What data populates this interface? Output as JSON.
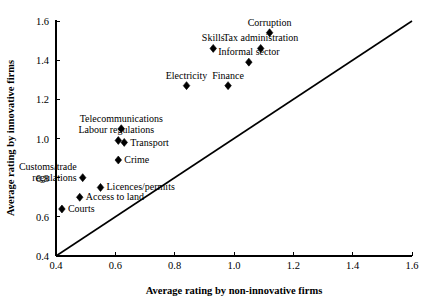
{
  "chart_data": {
    "type": "scatter",
    "title": "",
    "xlabel": "Average rating by non-innovative firms",
    "ylabel": "Average rating by innovative firms",
    "xlim": [
      0.4,
      1.6
    ],
    "ylim": [
      0.4,
      1.6
    ],
    "xticks": [
      "0.4",
      "0.6",
      "0.8",
      "1.0",
      "1.2",
      "1.4",
      "1.6"
    ],
    "yticks": [
      "0.4",
      "0.6",
      "0.8",
      "1.0",
      "1.2",
      "1.4",
      "1.6"
    ],
    "xtick_values": [
      0.4,
      0.6,
      0.8,
      1.0,
      1.2,
      1.4,
      1.6
    ],
    "ytick_values": [
      0.4,
      0.6,
      0.8,
      1.0,
      1.2,
      1.4,
      1.6
    ],
    "grid": false,
    "legend": false,
    "marker": "diamond",
    "marker_color": "#000000",
    "reference_line": {
      "name": "45-degree-line",
      "from": [
        0.4,
        0.4
      ],
      "to": [
        1.6,
        1.6
      ],
      "color": "#000000"
    },
    "points": [
      {
        "label": "Corruption",
        "x": 1.12,
        "y": 1.54,
        "label_dx": 0,
        "label_dy": -7,
        "anchor": "middle"
      },
      {
        "label": "Tax administration",
        "x": 1.09,
        "y": 1.46,
        "label_dx": 0,
        "label_dy": -7,
        "anchor": "middle"
      },
      {
        "label": "Skills",
        "x": 0.93,
        "y": 1.46,
        "label_dx": 0,
        "label_dy": -7,
        "anchor": "middle"
      },
      {
        "label": "Informal sector",
        "x": 1.05,
        "y": 1.39,
        "label_dx": 0,
        "label_dy": -7,
        "anchor": "middle"
      },
      {
        "label": "Electricity",
        "x": 0.84,
        "y": 1.27,
        "label_dx": 0,
        "label_dy": -7,
        "anchor": "middle"
      },
      {
        "label": "Finance",
        "x": 0.98,
        "y": 1.27,
        "label_dx": 0,
        "label_dy": -7,
        "anchor": "middle"
      },
      {
        "label": "Telecommunications",
        "x": 0.62,
        "y": 1.05,
        "label_dx": 0,
        "label_dy": -7,
        "anchor": "middle"
      },
      {
        "label": "Labour regulations",
        "x": 0.61,
        "y": 0.99,
        "label_dx": -2,
        "label_dy": -7,
        "anchor": "middle"
      },
      {
        "label": "Transport",
        "x": 0.63,
        "y": 0.98,
        "label_dx": 6,
        "label_dy": 4,
        "anchor": "start"
      },
      {
        "label": "Crime",
        "x": 0.61,
        "y": 0.89,
        "label_dx": 6,
        "label_dy": 3,
        "anchor": "start"
      },
      {
        "label": "Customs/trade regulations",
        "x": 0.49,
        "y": 0.8,
        "label_dx": -6,
        "label_dy": -8,
        "anchor": "end"
      },
      {
        "label": "Licences/permits",
        "x": 0.55,
        "y": 0.75,
        "label_dx": 6,
        "label_dy": 3,
        "anchor": "start"
      },
      {
        "label": "Access to land",
        "x": 0.48,
        "y": 0.7,
        "label_dx": 6,
        "label_dy": 3,
        "anchor": "start"
      },
      {
        "label": "Courts",
        "x": 0.42,
        "y": 0.64,
        "label_dx": 6,
        "label_dy": 3,
        "anchor": "start"
      }
    ]
  }
}
